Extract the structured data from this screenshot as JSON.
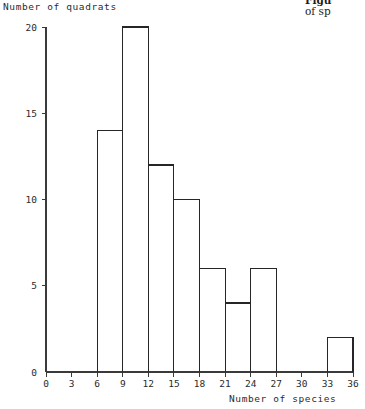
{
  "figure": {
    "y_axis_title": "Number of quadrats",
    "x_axis_title": "Number of species",
    "caption_fragment_line1": "Figu",
    "caption_fragment_line2": "of sp",
    "line_color": "#262626",
    "axis_color": "#3a3a3a",
    "background": "#ffffff"
  },
  "chart_data": {
    "type": "bar",
    "title": "",
    "subtitle": "",
    "xlabel": "Number of species",
    "ylabel": "Number of quadrats",
    "xlim": [
      0,
      36
    ],
    "ylim": [
      0,
      20
    ],
    "xticks": [
      0,
      3,
      6,
      9,
      12,
      15,
      18,
      21,
      24,
      27,
      30,
      33,
      36
    ],
    "yticks": [
      0,
      5,
      10,
      15,
      20
    ],
    "xtick_labels": [
      "0",
      "3",
      "6",
      "9",
      "12",
      "15",
      "18",
      "21",
      "24",
      "27",
      "30",
      "33",
      "36"
    ],
    "ytick_labels": [
      "0",
      "5",
      "10",
      "15",
      "20"
    ],
    "grid": false,
    "legend": false,
    "bin_width": 3,
    "bin_edges": [
      0,
      3,
      6,
      9,
      12,
      15,
      18,
      21,
      24,
      27,
      30,
      33,
      36
    ],
    "categories": [
      "0-3",
      "3-6",
      "6-9",
      "9-12",
      "12-15",
      "15-18",
      "18-21",
      "21-24",
      "24-27",
      "27-30",
      "30-33",
      "33-36"
    ],
    "values": [
      0,
      0,
      14,
      20,
      12,
      10,
      6,
      4,
      6,
      0,
      0,
      2
    ],
    "bars": [
      {
        "from": 0,
        "to": 3,
        "value": 0
      },
      {
        "from": 3,
        "to": 6,
        "value": 0
      },
      {
        "from": 6,
        "to": 9,
        "value": 14
      },
      {
        "from": 9,
        "to": 12,
        "value": 20
      },
      {
        "from": 12,
        "to": 15,
        "value": 12
      },
      {
        "from": 15,
        "to": 18,
        "value": 10
      },
      {
        "from": 18,
        "to": 21,
        "value": 6
      },
      {
        "from": 21,
        "to": 24,
        "value": 4
      },
      {
        "from": 24,
        "to": 27,
        "value": 6
      },
      {
        "from": 27,
        "to": 30,
        "value": 0
      },
      {
        "from": 30,
        "to": 33,
        "value": 0
      },
      {
        "from": 33,
        "to": 36,
        "value": 2
      }
    ],
    "total_quadrats": 70
  }
}
